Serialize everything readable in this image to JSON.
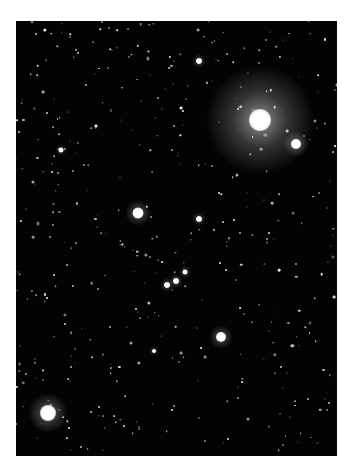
{
  "scene": {
    "background": "#ffffff",
    "sky_color": "#030303",
    "frame": {
      "x": 16,
      "y": 21,
      "width": 321,
      "height": 435
    },
    "bright_stars": [
      {
        "x": 260,
        "y": 120,
        "core": 22,
        "halo": 110,
        "halo_alpha": 0.55
      },
      {
        "x": 48,
        "y": 413,
        "core": 16,
        "halo": 40,
        "halo_alpha": 0.5
      },
      {
        "x": 296,
        "y": 144,
        "core": 10,
        "halo": 26,
        "halo_alpha": 0.45
      },
      {
        "x": 138,
        "y": 213,
        "core": 11,
        "halo": 26,
        "halo_alpha": 0.45
      },
      {
        "x": 221,
        "y": 337,
        "core": 10,
        "halo": 24,
        "halo_alpha": 0.45
      },
      {
        "x": 199,
        "y": 61,
        "core": 6,
        "halo": 14,
        "halo_alpha": 0.4
      },
      {
        "x": 199,
        "y": 219,
        "core": 6,
        "halo": 14,
        "halo_alpha": 0.4
      },
      {
        "x": 167,
        "y": 285,
        "core": 6,
        "halo": 14,
        "halo_alpha": 0.4
      },
      {
        "x": 176,
        "y": 281,
        "core": 6,
        "halo": 14,
        "halo_alpha": 0.4
      },
      {
        "x": 185,
        "y": 272,
        "core": 5,
        "halo": 12,
        "halo_alpha": 0.4
      },
      {
        "x": 61,
        "y": 150,
        "core": 5,
        "halo": 12,
        "halo_alpha": 0.35
      },
      {
        "x": 154,
        "y": 351,
        "core": 4,
        "halo": 10,
        "halo_alpha": 0.35
      }
    ],
    "faint_star_count": 420,
    "seed": 7
  }
}
